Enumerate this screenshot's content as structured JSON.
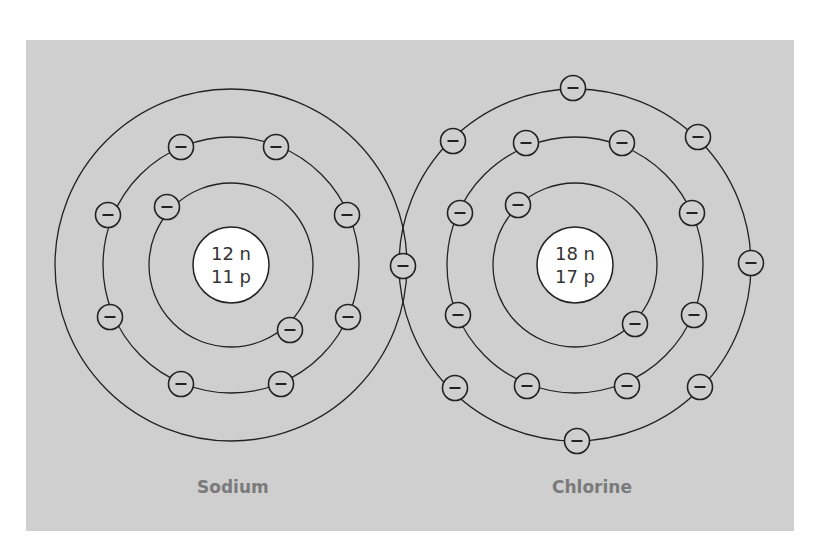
{
  "diagram": {
    "colors": {
      "background": "#ffffff",
      "panel": "#cfcfcf",
      "line": "#222222",
      "nucleus_fill": "#ffffff",
      "label": "#7a7a7a"
    },
    "atoms": [
      {
        "name": "Sodium",
        "nucleus": {
          "neutrons": "12 n",
          "protons": "11 p"
        },
        "center": [
          231,
          265
        ],
        "shells": [
          {
            "radius": 82,
            "electrons": 2
          },
          {
            "radius": 128,
            "electrons": 8
          },
          {
            "radius": 176,
            "electrons": 1
          }
        ]
      },
      {
        "name": "Chlorine",
        "nucleus": {
          "neutrons": "18 n",
          "protons": "17 p"
        },
        "center": [
          575,
          265
        ],
        "shells": [
          {
            "radius": 82,
            "electrons": 2
          },
          {
            "radius": 128,
            "electrons": 8
          },
          {
            "radius": 176,
            "electrons": 7
          }
        ]
      }
    ],
    "electron_symbol": "−",
    "labels": {
      "sodium": "Sodium",
      "chlorine": "Chlorine"
    }
  }
}
